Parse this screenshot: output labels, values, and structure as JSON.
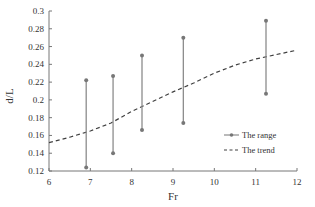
{
  "chart_data": {
    "type": "line",
    "title": "",
    "xlabel": "Fr",
    "ylabel": "d/L",
    "xlim": [
      6,
      12
    ],
    "ylim": [
      0.12,
      0.3
    ],
    "xticks": [
      6,
      7,
      8,
      9,
      10,
      11,
      12
    ],
    "yticks": [
      0.12,
      0.14,
      0.16,
      0.18,
      0.2,
      0.22,
      0.24,
      0.26,
      0.28,
      0.3
    ],
    "ytick_labels": [
      "0.12",
      "0.14",
      "0.16",
      "0.18",
      "0.2",
      "0.22",
      "0.24",
      "0.26",
      "0.28",
      "0.3"
    ],
    "grid": false,
    "legend_position": "lower right (inside)",
    "series": [
      {
        "name": "The range",
        "style": "vertical range bars with circle markers",
        "color": "#8c8c8c",
        "ranges": [
          {
            "x": 6.9,
            "low": 0.124,
            "high": 0.222
          },
          {
            "x": 7.55,
            "low": 0.14,
            "high": 0.227
          },
          {
            "x": 8.25,
            "low": 0.166,
            "high": 0.25
          },
          {
            "x": 9.25,
            "low": 0.174,
            "high": 0.27
          },
          {
            "x": 11.25,
            "low": 0.207,
            "high": 0.289
          }
        ]
      },
      {
        "name": "The trend",
        "style": "dashed",
        "color": "#404040",
        "x": [
          6,
          6.5,
          7,
          7.5,
          8,
          8.5,
          9,
          9.5,
          10,
          10.5,
          11,
          11.5,
          12
        ],
        "y": [
          0.152,
          0.158,
          0.165,
          0.174,
          0.187,
          0.198,
          0.209,
          0.219,
          0.23,
          0.239,
          0.246,
          0.251,
          0.256
        ]
      }
    ]
  }
}
